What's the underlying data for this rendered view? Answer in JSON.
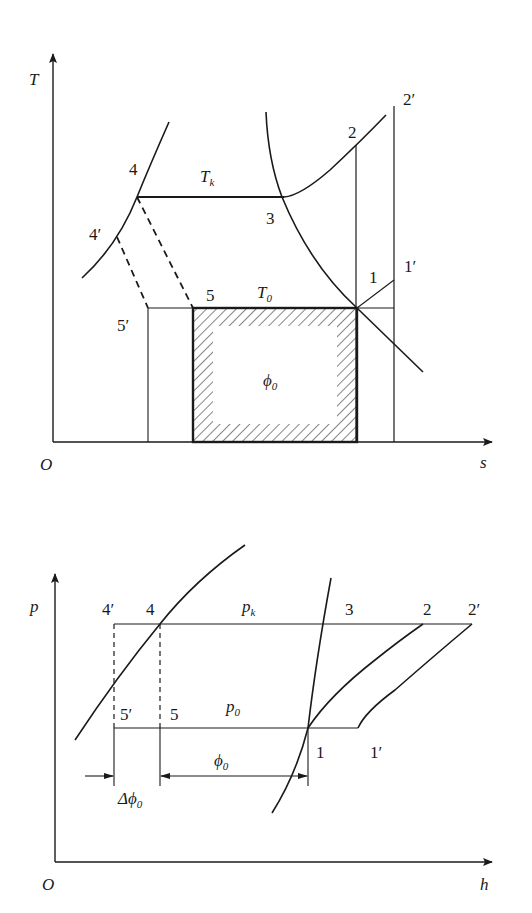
{
  "ts_diagram": {
    "axes": {
      "y_label": "T",
      "x_label": "s",
      "origin": "O"
    },
    "lines": {
      "condensing": "T",
      "condensing_sub": "k",
      "evaporating": "T",
      "evaporating_sub": "0"
    },
    "area_label": "ϕ",
    "area_sub": "0",
    "points": {
      "p1": "1",
      "p1p": "1′",
      "p2": "2",
      "p2p": "2′",
      "p3": "3",
      "p4": "4",
      "p4p": "4′",
      "p5": "5",
      "p5p": "5′"
    }
  },
  "ph_diagram": {
    "axes": {
      "y_label": "p",
      "x_label": "h",
      "origin": "O"
    },
    "lines": {
      "condensing": "p",
      "condensing_sub": "k",
      "evaporating": "p",
      "evaporating_sub": "0"
    },
    "dims": {
      "phi": "ϕ",
      "phi_sub": "0",
      "dphi": "Δϕ",
      "dphi_sub": "0"
    },
    "points": {
      "p1": "1",
      "p1p": "1′",
      "p2": "2",
      "p2p": "2′",
      "p3": "3",
      "p4": "4",
      "p4p": "4′",
      "p5": "5",
      "p5p": "5′"
    }
  }
}
